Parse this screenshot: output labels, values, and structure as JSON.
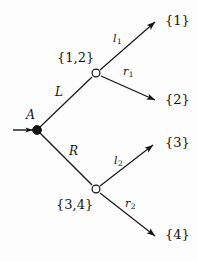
{
  "figure": {
    "type": "decision-tree-diagram",
    "background_color": "#fdfdfd",
    "ink_color": "#141414",
    "width": 197,
    "height": 262
  },
  "nodes": {
    "root": {
      "label": "ᴀ",
      "display_label": "A",
      "style": "filled-circle",
      "x": 37,
      "y": 130
    },
    "upper_decision": {
      "label": "{1,2}",
      "style": "open-circle",
      "x": 96,
      "y": 73
    },
    "lower_decision": {
      "label": "{3,4}",
      "style": "open-circle",
      "x": 96,
      "y": 189
    }
  },
  "outcomes": [
    {
      "label": "{1}",
      "x": 165,
      "y": 14
    },
    {
      "label": "{2}",
      "x": 165,
      "y": 93
    },
    {
      "label": "{3}",
      "x": 165,
      "y": 136
    },
    {
      "label": "{4}",
      "x": 165,
      "y": 228
    }
  ],
  "edges": {
    "root_upper": {
      "label": "L"
    },
    "root_lower": {
      "label": "R"
    },
    "upper_left": {
      "label": "l",
      "subscript": "1"
    },
    "upper_right": {
      "label": "r",
      "subscript": "1"
    },
    "lower_left": {
      "label": "l",
      "subscript": "2"
    },
    "lower_right": {
      "label": "r",
      "subscript": "2"
    }
  },
  "entry_arrow": {
    "name": "initial-state-arrow",
    "from_x": 13,
    "to_x": 33,
    "y": 130
  }
}
